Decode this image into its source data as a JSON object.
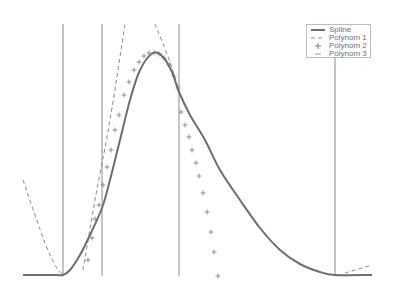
{
  "chart_data": {
    "type": "line",
    "title": "",
    "xlabel": "",
    "ylabel": "",
    "grid": false,
    "legend_position": "upper right",
    "knots_px": [
      63,
      102,
      179,
      335
    ],
    "series": [
      {
        "name": "Spline",
        "style": "solid",
        "color": "#6e6e6e",
        "points_px": [
          [
            23,
            275
          ],
          [
            55,
            275
          ],
          [
            63,
            275
          ],
          [
            70,
            270
          ],
          [
            80,
            255
          ],
          [
            90,
            235
          ],
          [
            102,
            208
          ],
          [
            110,
            180
          ],
          [
            120,
            140
          ],
          [
            130,
            100
          ],
          [
            140,
            70
          ],
          [
            153,
            53
          ],
          [
            163,
            57
          ],
          [
            172,
            72
          ],
          [
            179,
            92
          ],
          [
            190,
            115
          ],
          [
            205,
            140
          ],
          [
            220,
            170
          ],
          [
            240,
            200
          ],
          [
            260,
            228
          ],
          [
            280,
            250
          ],
          [
            300,
            264
          ],
          [
            320,
            272
          ],
          [
            335,
            275
          ],
          [
            372,
            275
          ]
        ]
      },
      {
        "name": "Polynom 1",
        "style": "dashed",
        "color": "#8a8a8a",
        "segments_px": [
          [
            [
              23,
              180
            ],
            [
              35,
              215
            ],
            [
              45,
              243
            ],
            [
              55,
              265
            ],
            [
              63,
              275
            ]
          ],
          [
            [
              83,
              270
            ],
            [
              95,
              200
            ],
            [
              110,
              120
            ],
            [
              125,
              24
            ]
          ],
          [
            [
              155,
              24
            ],
            [
              170,
              62
            ],
            [
              180,
              95
            ]
          ],
          [
            [
              345,
              273
            ],
            [
              372,
              265
            ]
          ]
        ]
      },
      {
        "name": "Polynom 2",
        "style": "marker-plus",
        "color": "#7a7a7a",
        "points_px": [
          [
            88,
            260
          ],
          [
            92,
            238
          ],
          [
            95,
            219
          ],
          [
            99,
            205
          ],
          [
            103,
            185
          ],
          [
            107,
            167
          ],
          [
            111,
            150
          ],
          [
            115,
            130
          ],
          [
            119,
            115
          ],
          [
            124,
            95
          ],
          [
            129,
            82
          ],
          [
            134,
            70
          ],
          [
            139,
            62
          ],
          [
            144,
            56
          ],
          [
            149,
            53
          ],
          [
            154,
            53
          ],
          [
            159,
            54
          ],
          [
            164,
            58
          ],
          [
            169,
            65
          ],
          [
            174,
            76
          ],
          [
            178,
            88
          ],
          [
            181,
            112
          ],
          [
            185,
            125
          ],
          [
            189,
            137
          ],
          [
            192,
            150
          ],
          [
            196,
            163
          ],
          [
            199,
            176
          ],
          [
            203,
            193
          ],
          [
            207,
            212
          ],
          [
            211,
            232
          ],
          [
            214,
            252
          ],
          [
            218,
            276
          ]
        ]
      },
      {
        "name": "Polynom 3",
        "style": "marker-minus",
        "color": "#9a9a9a",
        "points_px": []
      }
    ]
  },
  "legend": {
    "items": [
      {
        "label": "Spline",
        "style": "solid"
      },
      {
        "label": "Polynom 1",
        "style": "dashed"
      },
      {
        "label": "Polynom 2",
        "style": "plus"
      },
      {
        "label": "Polynom 3",
        "style": "minus"
      }
    ]
  }
}
